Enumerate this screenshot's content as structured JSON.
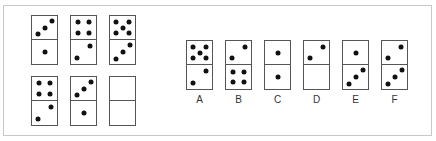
{
  "puzzle": {
    "grid": [
      {
        "top": 3,
        "bottom": 1
      },
      {
        "top": 4,
        "bottom": 2
      },
      {
        "top": 5,
        "bottom": 3
      },
      {
        "top": 4,
        "bottom": 2
      },
      {
        "top": 3,
        "bottom": 1
      },
      {
        "top": null,
        "bottom": null
      }
    ],
    "options": [
      {
        "label": "A",
        "top": 5,
        "bottom": 2
      },
      {
        "label": "B",
        "top": 2,
        "bottom": 4
      },
      {
        "label": "C",
        "top": 1,
        "bottom": 1
      },
      {
        "label": "D",
        "top": 2,
        "bottom": 0
      },
      {
        "label": "E",
        "top": 1,
        "bottom": 3
      },
      {
        "label": "F",
        "top": 2,
        "bottom": 3
      }
    ]
  }
}
